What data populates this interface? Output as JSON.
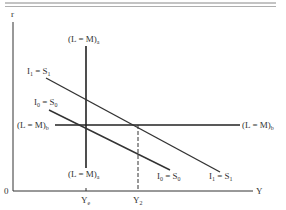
{
  "diagram": {
    "axis_labels": {
      "y": "r",
      "x": "Y",
      "origin": "0"
    },
    "x_ticks": [
      {
        "main": "Y",
        "sub": "e"
      },
      {
        "main": "Y",
        "sub": "2"
      }
    ],
    "curves": {
      "lm_a_top": {
        "main": "(L = M)",
        "sub": "a"
      },
      "lm_a_bottom": {
        "main": "(L = M)",
        "sub": "a"
      },
      "lm_b_left": {
        "main": "(L = M)",
        "sub": "b"
      },
      "lm_b_right": {
        "main": "(L = M)",
        "sub": "b"
      },
      "is1_top": {
        "a": "I",
        "a_sub": "1",
        "eq": " = ",
        "b": "S",
        "b_sub": "1"
      },
      "is0_top": {
        "a": "I",
        "a_sub": "0",
        "eq": " = ",
        "b": "S",
        "b_sub": "0"
      },
      "is0_bottom": {
        "a": "I",
        "a_sub": "0",
        "eq": " = ",
        "b": "S",
        "b_sub": "0"
      },
      "is1_bottom": {
        "a": "I",
        "a_sub": "1",
        "eq": " = ",
        "b": "S",
        "b_sub": "1"
      }
    },
    "colors": {
      "line": "#2a2a2a",
      "rule": "#888888",
      "text": "#333333"
    }
  }
}
